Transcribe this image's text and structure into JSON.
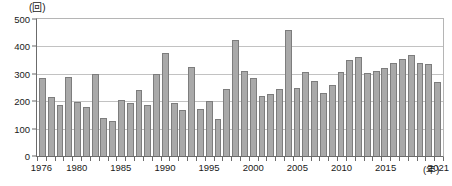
{
  "chart_data": {
    "type": "bar",
    "title": "",
    "subtitle": "",
    "xlabel": "(年)",
    "ylabel": "(回)",
    "unit_label": "(回)",
    "xaxis_unit": "(年)",
    "ylim": [
      0,
      500
    ],
    "yticks": [
      0,
      100,
      200,
      300,
      400,
      500
    ],
    "ytick_labels": [
      "0",
      "100",
      "200",
      "300",
      "400",
      "500"
    ],
    "grid": true,
    "grid_axis": "y",
    "legend": "none",
    "bar_color": "#a9a9a9",
    "bar_edge_color": "#7d7d7d",
    "axis_color": "#6b6b6b",
    "gridline_color": "#c2c2c2",
    "xtick_years": [
      1976,
      1980,
      1985,
      1990,
      1995,
      2000,
      2005,
      2010,
      2015,
      2021
    ],
    "xtick_labels": [
      "1976",
      "1980",
      "1985",
      "1990",
      "1995",
      "2000",
      "2005",
      "2010",
      "2015",
      "2021"
    ],
    "categories": [
      "1976",
      "1977",
      "1978",
      "1979",
      "1980",
      "1981",
      "1982",
      "1983",
      "1984",
      "1985",
      "1986",
      "1987",
      "1988",
      "1989",
      "1990",
      "1991",
      "1992",
      "1993",
      "1994",
      "1995",
      "1996",
      "1997",
      "1998",
      "1999",
      "2000",
      "2001",
      "2002",
      "2003",
      "2004",
      "2005",
      "2006",
      "2007",
      "2008",
      "2009",
      "2010",
      "2011",
      "2012",
      "2013",
      "2014",
      "2015",
      "2016",
      "2017",
      "2018",
      "2019",
      "2020",
      "2021"
    ],
    "values": [
      283,
      215,
      185,
      288,
      198,
      180,
      300,
      140,
      128,
      203,
      195,
      240,
      185,
      300,
      375,
      195,
      168,
      325,
      170,
      200,
      135,
      245,
      425,
      310,
      285,
      220,
      228,
      245,
      460,
      250,
      305,
      272,
      230,
      260,
      305,
      350,
      360,
      302,
      310,
      320,
      340,
      355,
      370,
      340,
      335,
      270
    ]
  }
}
